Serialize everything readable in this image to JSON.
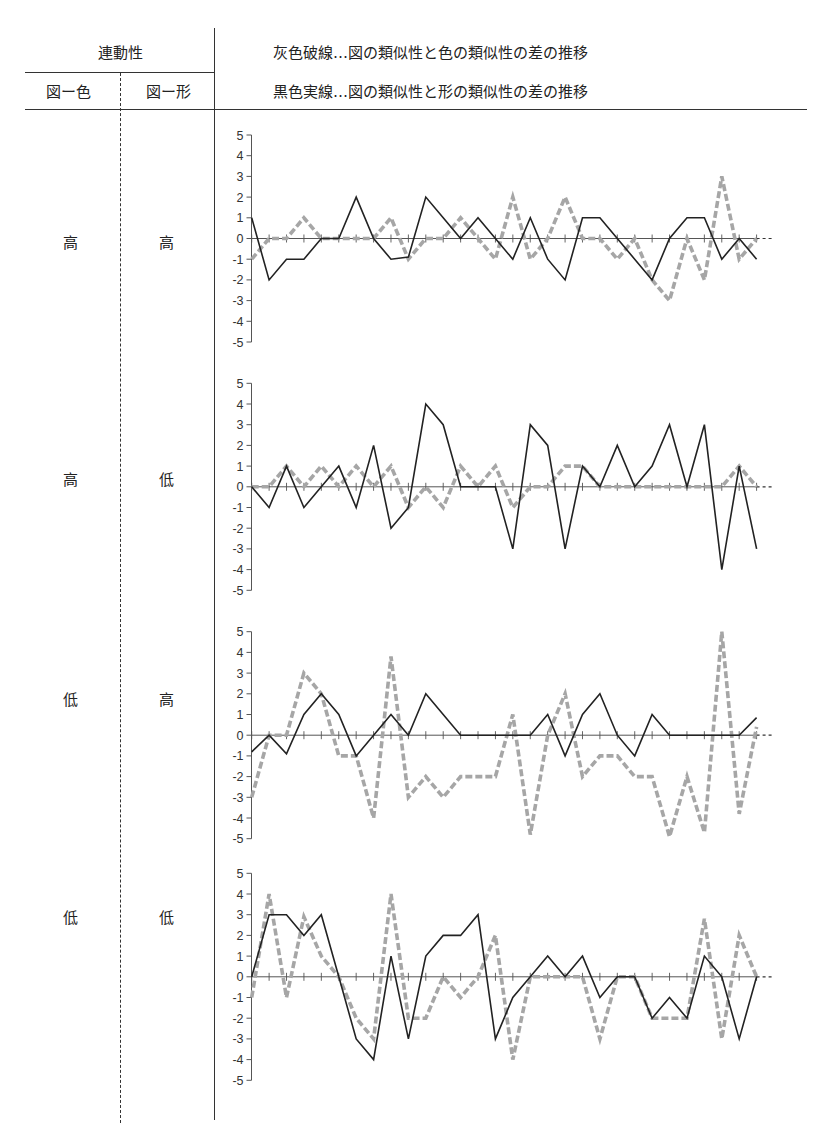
{
  "header": {
    "group_title": "連動性",
    "col_color": "図ー色",
    "col_shape": "図ー形",
    "legend_gray": "灰色破線…図の類似性と色の類似性の差の推移",
    "legend_black": "黒色実線…図の類似性と形の類似性の差の推移"
  },
  "rows": [
    {
      "color": "高",
      "shape": "高"
    },
    {
      "color": "高",
      "shape": "低"
    },
    {
      "color": "低",
      "shape": "高"
    },
    {
      "color": "低",
      "shape": "低"
    }
  ],
  "colors": {
    "gray_series": "#a6a6a6",
    "black_series": "#222222",
    "axis": "#555555"
  },
  "chart_data": [
    {
      "type": "line",
      "title": "連動性 図ー色:高 / 図ー形:高",
      "xlabel": "",
      "ylabel": "",
      "ylim": [
        -5,
        5
      ],
      "yticks": [
        5,
        4,
        3,
        2,
        1,
        0,
        -1,
        -2,
        -3,
        -4,
        -5
      ],
      "x": [
        1,
        2,
        3,
        4,
        5,
        6,
        7,
        8,
        9,
        10,
        11,
        12,
        13,
        14,
        15,
        16,
        17,
        18,
        19,
        20,
        21,
        22,
        23,
        24,
        25,
        26,
        27,
        28,
        29,
        30
      ],
      "grid": false,
      "series": [
        {
          "name": "灰色破線 (図の類似性と色の類似性の差)",
          "style": "dashed-gray",
          "values": [
            -1,
            0,
            0,
            1,
            0,
            0,
            0,
            0,
            1,
            -1,
            0,
            0,
            1,
            0,
            -1,
            2,
            -1,
            0,
            2,
            0,
            0,
            -1,
            0,
            -2,
            -3,
            0,
            -2,
            3,
            -1,
            0
          ]
        },
        {
          "name": "黒色実線 (図の類似性と形の類似性の差)",
          "style": "solid-black",
          "values": [
            1,
            -2,
            -1,
            -1,
            0,
            0,
            2,
            0,
            -1,
            -0.9,
            2,
            1,
            0,
            1,
            0,
            -1,
            1,
            -1,
            -2,
            1,
            1,
            0,
            -1,
            -2,
            0,
            1,
            1,
            -1,
            0,
            -1
          ]
        }
      ]
    },
    {
      "type": "line",
      "title": "連動性 図ー色:高 / 図ー形:低",
      "xlabel": "",
      "ylabel": "",
      "ylim": [
        -5,
        5
      ],
      "yticks": [
        5,
        4,
        3,
        2,
        1,
        0,
        -1,
        -2,
        -3,
        -4,
        -5
      ],
      "x": [
        1,
        2,
        3,
        4,
        5,
        6,
        7,
        8,
        9,
        10,
        11,
        12,
        13,
        14,
        15,
        16,
        17,
        18,
        19,
        20,
        21,
        22,
        23,
        24,
        25,
        26,
        27,
        28,
        29,
        30
      ],
      "grid": false,
      "series": [
        {
          "name": "灰色破線 (図の類似性と色の類似性の差)",
          "style": "dashed-gray",
          "values": [
            0,
            0,
            1,
            0,
            1,
            0,
            1,
            0,
            1,
            -1,
            0,
            -1,
            1,
            0,
            1,
            -1,
            0,
            0,
            1,
            1,
            0,
            0,
            0,
            0,
            0,
            0,
            0,
            0,
            1,
            0
          ]
        },
        {
          "name": "黒色実線 (図の類似性と形の類似性の差)",
          "style": "solid-black",
          "values": [
            0,
            -1,
            1,
            -1,
            0,
            1,
            -1,
            2,
            -2,
            -1,
            4,
            3,
            0,
            0,
            0,
            -3,
            3,
            2,
            -3,
            1,
            0,
            2,
            0,
            1,
            3,
            0,
            3,
            -4,
            1,
            -3
          ]
        }
      ]
    },
    {
      "type": "line",
      "title": "連動性 図ー色:低 / 図ー形:高",
      "xlabel": "",
      "ylabel": "",
      "ylim": [
        -5,
        5
      ],
      "yticks": [
        5,
        4,
        3,
        2,
        1,
        0,
        -1,
        -2,
        -3,
        -4,
        -5
      ],
      "x": [
        1,
        2,
        3,
        4,
        5,
        6,
        7,
        8,
        9,
        10,
        11,
        12,
        13,
        14,
        15,
        16,
        17,
        18,
        19,
        20,
        21,
        22,
        23,
        24,
        25,
        26,
        27,
        28,
        29,
        30
      ],
      "grid": false,
      "series": [
        {
          "name": "灰色破線 (図の類似性と色の類似性の差)",
          "style": "dashed-gray",
          "values": [
            -3,
            0,
            0,
            3,
            2,
            -1,
            -1,
            -4,
            3.8,
            -3,
            -2,
            -3,
            -2,
            -2,
            -2,
            1,
            -4.8,
            0,
            2,
            -2,
            -1,
            -1,
            -2,
            -2,
            -4.9,
            -2,
            -4.7,
            5,
            -3.8,
            0.4
          ]
        },
        {
          "name": "黒色実線 (図の類似性と形の類似性の差)",
          "style": "solid-black",
          "values": [
            -0.8,
            0,
            -0.9,
            1,
            2,
            1,
            -1,
            0,
            1,
            0,
            2,
            1,
            0,
            0,
            0,
            0,
            0,
            1,
            -1,
            1,
            2,
            0,
            -1,
            1,
            0,
            0,
            0,
            0,
            0,
            0.85
          ]
        }
      ]
    },
    {
      "type": "line",
      "title": "連動性 図ー色:低 / 図ー形:低",
      "xlabel": "",
      "ylabel": "",
      "ylim": [
        -5,
        5
      ],
      "yticks": [
        5,
        4,
        3,
        2,
        1,
        0,
        -1,
        -2,
        -3,
        -4,
        -5
      ],
      "x": [
        1,
        2,
        3,
        4,
        5,
        6,
        7,
        8,
        9,
        10,
        11,
        12,
        13,
        14,
        15,
        16,
        17,
        18,
        19,
        20,
        21,
        22,
        23,
        24,
        25,
        26,
        27,
        28,
        29,
        30
      ],
      "grid": false,
      "series": [
        {
          "name": "灰色破線 (図の類似性と色の類似性の差)",
          "style": "dashed-gray",
          "values": [
            -1,
            4,
            -1,
            2.9,
            1,
            0,
            -2,
            -3,
            4,
            -2,
            -2,
            0,
            -1,
            0,
            2,
            -4,
            0,
            0,
            0,
            0,
            -3,
            0,
            0,
            -2,
            -2,
            -2,
            2.8,
            -3,
            2,
            0
          ]
        },
        {
          "name": "黒色実線 (図の類似性と形の類似性の差)",
          "style": "solid-black",
          "values": [
            0,
            3,
            3,
            2,
            3,
            0,
            -3,
            -4,
            1,
            -3,
            1,
            2,
            2,
            3,
            -3,
            -1,
            0,
            1,
            0,
            1,
            -1,
            0,
            0,
            -2,
            -1,
            -2,
            1,
            0,
            -3,
            0
          ]
        }
      ]
    }
  ]
}
